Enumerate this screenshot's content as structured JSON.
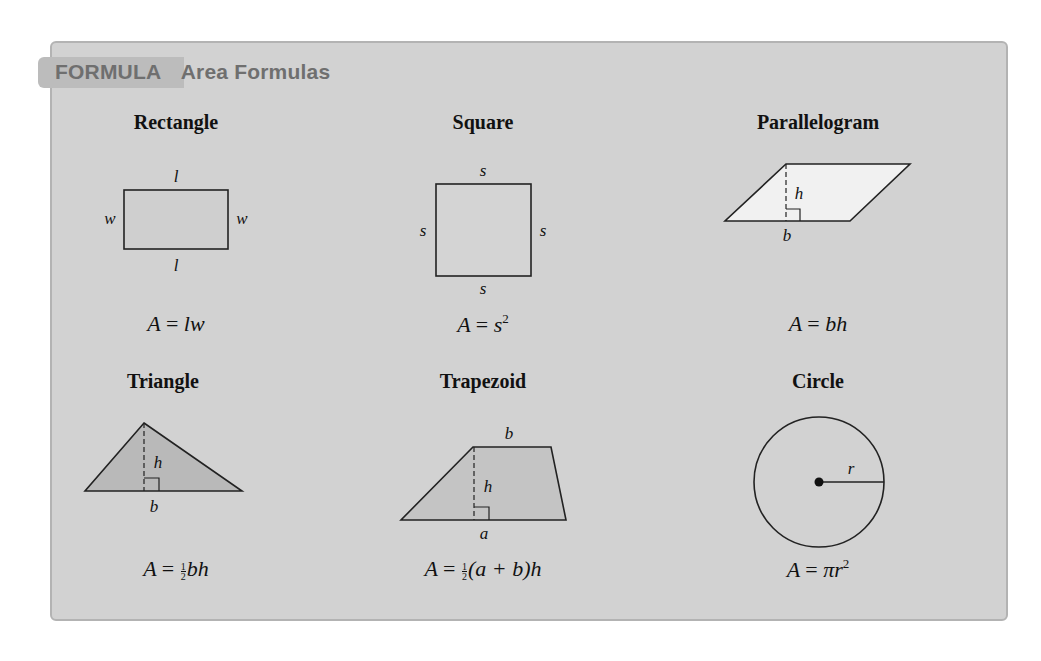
{
  "header": {
    "label": "FORMULA",
    "title": "Area Formulas"
  },
  "colors": {
    "panel_bg": "#d2d2d2",
    "tab_bg": "#bcbcbc",
    "header_text": "#6f6f6f",
    "shape_fill_dark": "#bdbdbd",
    "shape_fill_light": "#f1f1f1",
    "stroke": "#222222"
  },
  "shapes": [
    {
      "name": "Rectangle",
      "labels": {
        "top": "l",
        "bottom": "l",
        "left": "w",
        "right": "w"
      },
      "formula": {
        "lhs": "A",
        "eq": "=",
        "rhs": "lw"
      }
    },
    {
      "name": "Square",
      "labels": {
        "top": "s",
        "bottom": "s",
        "left": "s",
        "right": "s"
      },
      "formula": {
        "lhs": "A",
        "eq": "=",
        "base": "s",
        "exp": "2"
      }
    },
    {
      "name": "Parallelogram",
      "labels": {
        "height": "h",
        "base": "b"
      },
      "formula": {
        "lhs": "A",
        "eq": "=",
        "rhs": "bh"
      }
    },
    {
      "name": "Triangle",
      "labels": {
        "height": "h",
        "base": "b"
      },
      "formula": {
        "lhs": "A",
        "eq": "=",
        "frac_num": "1",
        "frac_den": "2",
        "rhs": "bh"
      }
    },
    {
      "name": "Trapezoid",
      "labels": {
        "top": "b",
        "height": "h",
        "bottom": "a"
      },
      "formula": {
        "lhs": "A",
        "eq": "=",
        "frac_num": "1",
        "frac_den": "2",
        "rhs_open": "(a + b)",
        "rhs_close": "h"
      }
    },
    {
      "name": "Circle",
      "labels": {
        "radius": "r"
      },
      "formula": {
        "lhs": "A",
        "eq": "=",
        "base": "πr",
        "exp": "2"
      }
    }
  ]
}
